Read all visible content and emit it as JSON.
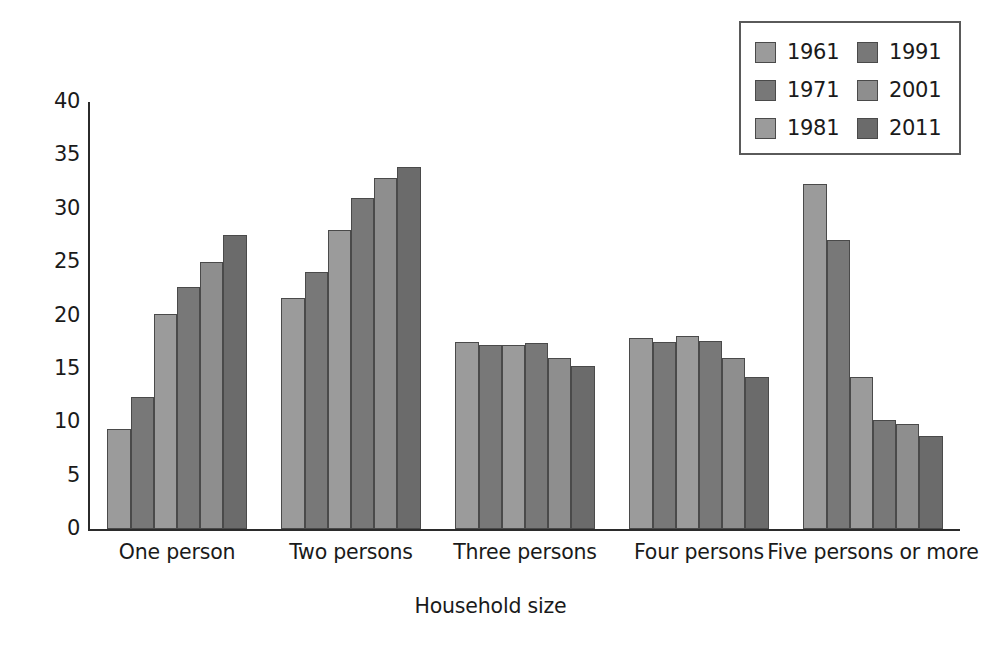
{
  "chart_data": {
    "type": "bar",
    "title": "",
    "subtitle": "",
    "xlabel": "Household size",
    "ylabel": "",
    "ylim": [
      0,
      40
    ],
    "yticks": [
      0,
      5,
      10,
      15,
      20,
      25,
      30,
      35,
      40
    ],
    "ytick_labels": [
      "0",
      "5",
      "10",
      "15",
      "20",
      "25",
      "30",
      "35",
      "40"
    ],
    "grid": false,
    "legend_position": "top-right",
    "categories": [
      "One person",
      "Two persons",
      "Three persons",
      "Four persons",
      "Five persons or more"
    ],
    "series": [
      {
        "name": "1961",
        "color": "#9b9b9b",
        "values": [
          9.4,
          21.6,
          17.5,
          17.9,
          32.3
        ]
      },
      {
        "name": "1971",
        "color": "#787878",
        "values": [
          12.4,
          24.1,
          17.2,
          17.5,
          27.1
        ]
      },
      {
        "name": "1981",
        "color": "#9b9b9b",
        "values": [
          20.1,
          28.0,
          17.2,
          18.1,
          14.2
        ]
      },
      {
        "name": "1991",
        "color": "#787878",
        "values": [
          22.7,
          31.0,
          17.4,
          17.6,
          10.2
        ]
      },
      {
        "name": "2001",
        "color": "#8e8e8e",
        "values": [
          25.0,
          32.9,
          16.0,
          16.0,
          9.8
        ]
      },
      {
        "name": "2011",
        "color": "#6b6b6b",
        "values": [
          27.5,
          33.9,
          15.3,
          14.2,
          8.7
        ]
      }
    ]
  },
  "legend": {
    "entries": [
      {
        "label": "1961"
      },
      {
        "label": "1971"
      },
      {
        "label": "1981"
      },
      {
        "label": "1991"
      },
      {
        "label": "2001"
      },
      {
        "label": "2011"
      }
    ]
  },
  "axis": {
    "x_title": "Household size"
  }
}
